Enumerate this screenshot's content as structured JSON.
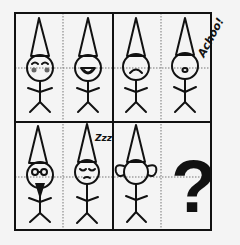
{
  "puzzle": {
    "title": "Gnome sequence puzzle",
    "grid": {
      "rows": 2,
      "cols": 4
    },
    "cells": [
      {
        "index": 0,
        "figure": "gnome",
        "expression": "blushing-happy",
        "label": ""
      },
      {
        "index": 1,
        "figure": "gnome",
        "expression": "big-smile",
        "label": ""
      },
      {
        "index": 2,
        "figure": "gnome",
        "expression": "frown",
        "label": ""
      },
      {
        "index": 3,
        "figure": "gnome",
        "expression": "sneezing",
        "label": "Achoo!"
      },
      {
        "index": 4,
        "figure": "gnome",
        "expression": "glasses-beard",
        "label": ""
      },
      {
        "index": 5,
        "figure": "gnome",
        "expression": "sleeping",
        "label": "Zzz"
      },
      {
        "index": 6,
        "figure": "gnome",
        "expression": "big-ears",
        "label": ""
      },
      {
        "index": 7,
        "figure": "unknown",
        "expression": "",
        "label": "?"
      }
    ],
    "annotations": {
      "sneeze": "Achoo!",
      "sleep": "Zzz",
      "question": "?"
    },
    "colors": {
      "ink": "#111111",
      "paper": "#f4f4f4",
      "guide": "#777777",
      "blush": "#666666"
    }
  }
}
